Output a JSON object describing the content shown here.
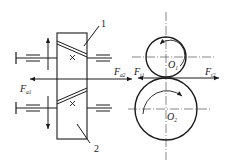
{
  "diagram": {
    "type": "helical gear pair force analysis",
    "colors": {
      "stroke": "#1a1a1a",
      "centerline": "#555555",
      "background": "#ffffff"
    },
    "parts": {
      "gear1_label": "1",
      "gear2_label": "2"
    },
    "centers": {
      "o1": {
        "main": "O",
        "sub": "1"
      },
      "o2": {
        "main": "O",
        "sub": "2"
      }
    },
    "forces": {
      "fa1": {
        "main": "F",
        "sub": "a1"
      },
      "fa2": {
        "main": "F",
        "sub": "a2"
      },
      "ft1": {
        "main": "F",
        "sub": "t1"
      },
      "ft2": {
        "main": "F",
        "sub": "t2"
      }
    },
    "rotation": {
      "o1": "counterclockwise",
      "o2": "clockwise"
    }
  }
}
